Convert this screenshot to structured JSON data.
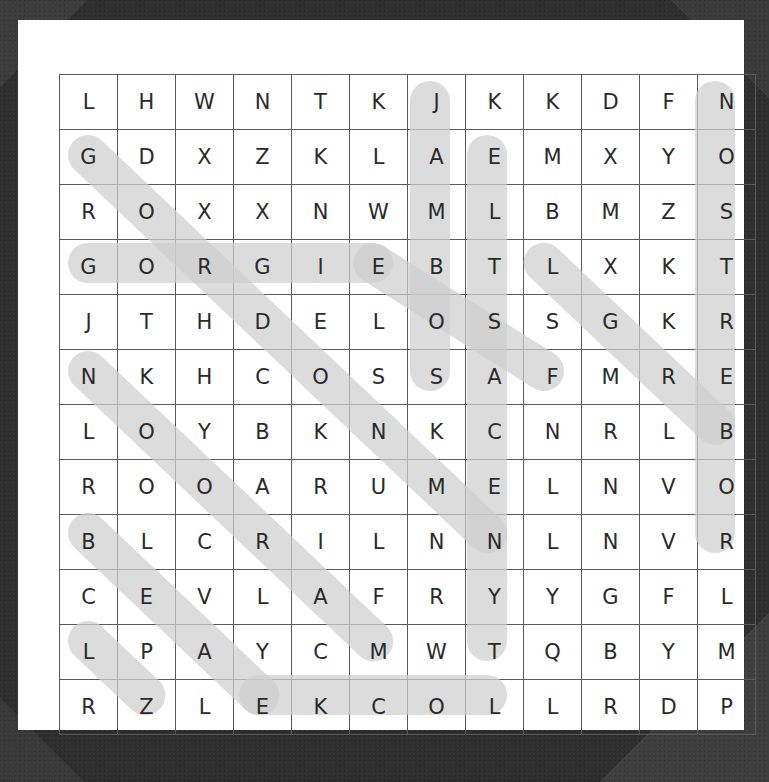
{
  "puzzle": {
    "type": "word-search",
    "rows": 12,
    "cols": 12,
    "highlight_color": "#cfcfcf",
    "page_color": "#ffffff",
    "background_color": "#2e2e2e",
    "grid_line_color": "#5a5a5a",
    "letter_color": "#2a2a2a",
    "grid": [
      [
        "L",
        "H",
        "W",
        "N",
        "T",
        "K",
        "J",
        "K",
        "K",
        "D",
        "F",
        "N"
      ],
      [
        "G",
        "D",
        "X",
        "Z",
        "K",
        "L",
        "A",
        "E",
        "M",
        "X",
        "Y",
        "O"
      ],
      [
        "R",
        "O",
        "X",
        "X",
        "N",
        "W",
        "M",
        "L",
        "B",
        "M",
        "Z",
        "S"
      ],
      [
        "G",
        "O",
        "R",
        "G",
        "I",
        "E",
        "B",
        "T",
        "L",
        "X",
        "K",
        "T"
      ],
      [
        "J",
        "T",
        "H",
        "D",
        "E",
        "L",
        "O",
        "S",
        "S",
        "G",
        "K",
        "R"
      ],
      [
        "N",
        "K",
        "H",
        "C",
        "O",
        "S",
        "S",
        "A",
        "F",
        "M",
        "R",
        "E"
      ],
      [
        "L",
        "O",
        "Y",
        "B",
        "K",
        "N",
        "K",
        "C",
        "N",
        "R",
        "L",
        "B"
      ],
      [
        "R",
        "O",
        "O",
        "A",
        "R",
        "U",
        "M",
        "E",
        "L",
        "N",
        "V",
        "O"
      ],
      [
        "B",
        "L",
        "C",
        "R",
        "I",
        "L",
        "N",
        "N",
        "L",
        "N",
        "V",
        "R"
      ],
      [
        "C",
        "E",
        "V",
        "L",
        "A",
        "F",
        "R",
        "Y",
        "Y",
        "G",
        "F",
        "L"
      ],
      [
        "L",
        "P",
        "A",
        "Y",
        "C",
        "M",
        "W",
        "T",
        "Q",
        "B",
        "Y",
        "M"
      ],
      [
        "R",
        "Z",
        "L",
        "E",
        "K",
        "C",
        "O",
        "L",
        "L",
        "R",
        "D",
        "P"
      ]
    ],
    "found_words": [
      {
        "text": "GORGIE",
        "start_row": 4,
        "start_col": 1,
        "end_row": 4,
        "end_col": 6,
        "direction": "horizontal-right"
      },
      {
        "text": "LOCKE",
        "start_row": 12,
        "start_col": 8,
        "end_row": 12,
        "end_col": 4,
        "direction": "horizontal-left"
      },
      {
        "text": "JAMBOS",
        "start_row": 1,
        "start_col": 7,
        "end_row": 6,
        "end_col": 7,
        "direction": "vertical-down"
      },
      {
        "text": "ELTSACENYT",
        "start_row": 2,
        "start_col": 8,
        "end_row": 11,
        "end_col": 8,
        "direction": "vertical-down"
      },
      {
        "text": "NOSTREBOR",
        "start_row": 1,
        "start_col": 12,
        "end_row": 9,
        "end_col": 12,
        "direction": "vertical-down"
      },
      {
        "text": "GOODWILL",
        "start_row": 2,
        "start_col": 1,
        "end_row": 9,
        "end_col": 8,
        "direction": "diagonal-down-right"
      },
      {
        "text": "NKHCOS",
        "start_row": 6,
        "start_col": 1,
        "end_row": 11,
        "end_col": 6,
        "direction": "diagonal-down-right"
      },
      {
        "text": "BLCRIL",
        "start_row": 9,
        "start_col": 1,
        "end_row": 12,
        "end_col": 4,
        "direction": "diagonal-down-right"
      },
      {
        "text": "LPAYCM",
        "start_row": 11,
        "start_col": 1,
        "end_row": 12,
        "end_col": 2,
        "direction": "diagonal-up-right"
      },
      {
        "text": "SOSLED",
        "start_row": 6,
        "start_col": 9,
        "end_row": 4,
        "end_col": 6,
        "direction": "diagonal-up-left"
      },
      {
        "text": "NKCAS",
        "start_row": 7,
        "start_col": 12,
        "end_row": 4,
        "end_col": 9,
        "direction": "diagonal-up-left"
      }
    ]
  }
}
